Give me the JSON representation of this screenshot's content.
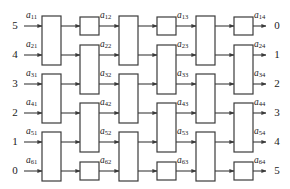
{
  "figure": {
    "name": "benes-switching-network",
    "stroke_color": "#3b3b3b",
    "box_fill": "#ffffff",
    "label_color": "#1a1a1a"
  },
  "inputs": [
    {
      "label": "5",
      "row": 1
    },
    {
      "label": "4",
      "row": 2
    },
    {
      "label": "3",
      "row": 3
    },
    {
      "label": "2",
      "row": 4
    },
    {
      "label": "1",
      "row": 5
    },
    {
      "label": "0",
      "row": 6
    }
  ],
  "outputs": [
    {
      "label": "0",
      "row": 1
    },
    {
      "label": "1",
      "row": 2
    },
    {
      "label": "2",
      "row": 3
    },
    {
      "label": "3",
      "row": 4
    },
    {
      "label": "4",
      "row": 5
    },
    {
      "label": "5",
      "row": 6
    }
  ],
  "edge_labels": [
    {
      "base": "a",
      "sub": "11",
      "row": 1,
      "stage": 1
    },
    {
      "base": "a",
      "sub": "21",
      "row": 2,
      "stage": 1
    },
    {
      "base": "a",
      "sub": "31",
      "row": 3,
      "stage": 1
    },
    {
      "base": "a",
      "sub": "41",
      "row": 4,
      "stage": 1
    },
    {
      "base": "a",
      "sub": "51",
      "row": 5,
      "stage": 1
    },
    {
      "base": "a",
      "sub": "61",
      "row": 6,
      "stage": 1
    },
    {
      "base": "a",
      "sub": "12",
      "row": 1,
      "stage": 2
    },
    {
      "base": "a",
      "sub": "22",
      "row": 2,
      "stage": 2
    },
    {
      "base": "a",
      "sub": "32",
      "row": 3,
      "stage": 2
    },
    {
      "base": "a",
      "sub": "42",
      "row": 4,
      "stage": 2
    },
    {
      "base": "a",
      "sub": "52",
      "row": 5,
      "stage": 2
    },
    {
      "base": "a",
      "sub": "62",
      "row": 6,
      "stage": 2
    },
    {
      "base": "a",
      "sub": "13",
      "row": 1,
      "stage": 3
    },
    {
      "base": "a",
      "sub": "23",
      "row": 2,
      "stage": 3
    },
    {
      "base": "a",
      "sub": "33",
      "row": 3,
      "stage": 3
    },
    {
      "base": "a",
      "sub": "43",
      "row": 4,
      "stage": 3
    },
    {
      "base": "a",
      "sub": "53",
      "row": 5,
      "stage": 3
    },
    {
      "base": "a",
      "sub": "63",
      "row": 6,
      "stage": 3
    },
    {
      "base": "a",
      "sub": "14",
      "row": 1,
      "stage": 4
    },
    {
      "base": "a",
      "sub": "24",
      "row": 2,
      "stage": 4
    },
    {
      "base": "a",
      "sub": "34",
      "row": 3,
      "stage": 4
    },
    {
      "base": "a",
      "sub": "44",
      "row": 4,
      "stage": 4
    },
    {
      "base": "a",
      "sub": "54",
      "row": 5,
      "stage": 4
    },
    {
      "base": "a",
      "sub": "64",
      "row": 6,
      "stage": 4
    }
  ],
  "switch_boxes": [
    {
      "column": 1,
      "rows": [
        1,
        2
      ],
      "kind": "tall"
    },
    {
      "column": 1,
      "rows": [
        3,
        4
      ],
      "kind": "tall"
    },
    {
      "column": 1,
      "rows": [
        5,
        6
      ],
      "kind": "tall"
    },
    {
      "column": 2,
      "rows": [
        1
      ],
      "kind": "short"
    },
    {
      "column": 2,
      "rows": [
        2,
        3
      ],
      "kind": "tall"
    },
    {
      "column": 2,
      "rows": [
        4,
        5
      ],
      "kind": "tall"
    },
    {
      "column": 2,
      "rows": [
        6
      ],
      "kind": "short"
    },
    {
      "column": 3,
      "rows": [
        1,
        2
      ],
      "kind": "tall"
    },
    {
      "column": 3,
      "rows": [
        3,
        4
      ],
      "kind": "tall"
    },
    {
      "column": 3,
      "rows": [
        5,
        6
      ],
      "kind": "tall"
    },
    {
      "column": 4,
      "rows": [
        1
      ],
      "kind": "short"
    },
    {
      "column": 4,
      "rows": [
        2,
        3
      ],
      "kind": "tall"
    },
    {
      "column": 4,
      "rows": [
        4,
        5
      ],
      "kind": "tall"
    },
    {
      "column": 4,
      "rows": [
        6
      ],
      "kind": "short"
    },
    {
      "column": 5,
      "rows": [
        1,
        2
      ],
      "kind": "tall"
    },
    {
      "column": 5,
      "rows": [
        3,
        4
      ],
      "kind": "tall"
    },
    {
      "column": 5,
      "rows": [
        5,
        6
      ],
      "kind": "tall"
    },
    {
      "column": 6,
      "rows": [
        1
      ],
      "kind": "short"
    },
    {
      "column": 6,
      "rows": [
        2,
        3
      ],
      "kind": "tall"
    },
    {
      "column": 6,
      "rows": [
        4,
        5
      ],
      "kind": "tall"
    },
    {
      "column": 6,
      "rows": [
        6
      ],
      "kind": "short"
    }
  ],
  "geometry": {
    "row_y": [
      26,
      55,
      84,
      113,
      142,
      171
    ],
    "col_left": [
      42,
      80,
      119,
      157,
      196,
      234
    ],
    "box_width": 19,
    "input_arrow_x0": 24,
    "output_arrow_x1": 266,
    "input_label_x": 8,
    "output_label_x": 270
  }
}
